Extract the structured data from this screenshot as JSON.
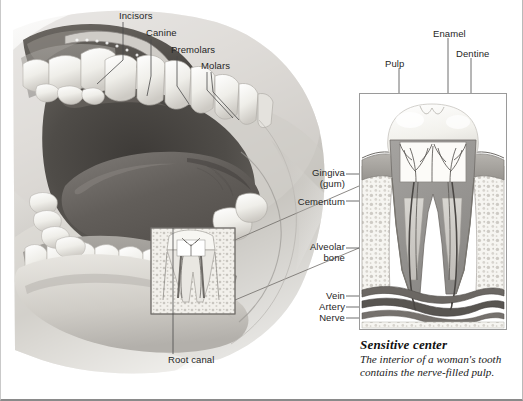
{
  "figure": {
    "type": "anatomical-illustration",
    "style": "grayscale medical illustration"
  },
  "main_illustration": {
    "name": "open-mouth-sagittal-view",
    "labels": [
      {
        "id": "incisors",
        "text": "Incisors",
        "x": 118,
        "y": 10,
        "anchor": "left"
      },
      {
        "id": "canine",
        "text": "Canine",
        "x": 145,
        "y": 27,
        "anchor": "left"
      },
      {
        "id": "premolars",
        "text": "Premolars",
        "x": 170,
        "y": 44,
        "anchor": "left"
      },
      {
        "id": "molars",
        "text": "Molars",
        "x": 200,
        "y": 60,
        "anchor": "left"
      },
      {
        "id": "root-canal",
        "text": "Root canal",
        "x": 167,
        "y": 358,
        "anchor": "left"
      }
    ]
  },
  "inset": {
    "name": "tooth-cross-section",
    "frame": {
      "x": 358,
      "y": 93,
      "width": 148,
      "height": 237
    },
    "labels_right_of_tooth": [
      {
        "id": "pulp",
        "text": "Pulp",
        "x": 384,
        "y": 56
      },
      {
        "id": "enamel",
        "text": "Enamel",
        "x": 437,
        "y": 25
      },
      {
        "id": "dentine",
        "text": "Dentine",
        "x": 455,
        "y": 45
      }
    ],
    "labels_left_of_tooth": [
      {
        "id": "gingiva",
        "text": "Gingiva\n(gum)",
        "x": 308,
        "y": 163
      },
      {
        "id": "cementum",
        "text": "Cementum",
        "x": 300,
        "y": 198
      },
      {
        "id": "alveolar-bone",
        "text": "Alveolar\nbone",
        "x": 312,
        "y": 240
      },
      {
        "id": "vein",
        "text": "Vein",
        "x": 330,
        "y": 293
      },
      {
        "id": "artery",
        "text": "Artery",
        "x": 322,
        "y": 304
      },
      {
        "id": "nerve",
        "text": "Nerve",
        "x": 325,
        "y": 315
      }
    ]
  },
  "caption": {
    "title": "Sensitive center",
    "body": "The interior of a woman's tooth contains the nerve-filled pulp."
  },
  "colors": {
    "background": "#ffffff",
    "label_text": "#262626",
    "leader_line": "#4a4a4a",
    "inset_border": "#9a9a9a",
    "enamel": "#f4f2ee",
    "dentine": "#9b9a97",
    "pulp": "#6e6d6b",
    "bone": "#f0eee9",
    "gum": "#b4b1ac",
    "vessel": "#5e5b57",
    "mouth_dark": "#4a4744",
    "tongue": "#6a6663",
    "tooth_white": "#f6f5f1"
  }
}
